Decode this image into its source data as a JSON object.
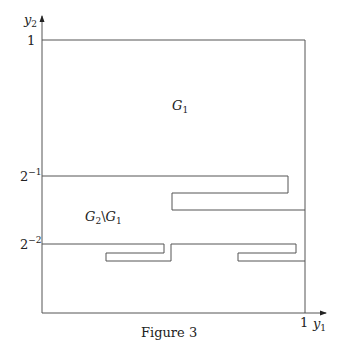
{
  "figure": {
    "caption": "Figure 3",
    "axes": {
      "x_label": "y",
      "x_label_sub": "1",
      "y_label": "y",
      "y_label_sub": "2",
      "x_ticks": [
        {
          "label": "1"
        }
      ],
      "y_ticks": [
        {
          "base": "1",
          "exp": ""
        },
        {
          "base": "2",
          "exp": "−1"
        },
        {
          "base": "2",
          "exp": "−2"
        }
      ]
    },
    "regions": {
      "g1": {
        "base": "G",
        "sub": "1"
      },
      "g2_minus_g1": {
        "base1": "G",
        "sub1": "2",
        "sep": "\\",
        "base2": "G",
        "sub2": "1"
      }
    }
  }
}
